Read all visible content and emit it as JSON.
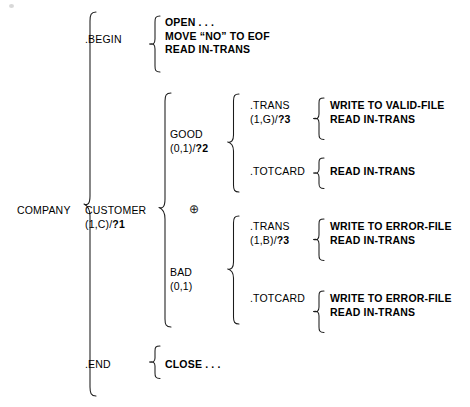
{
  "diagram": {
    "type": "warnier-orr",
    "root": {
      "name": "COMPANY",
      "label": "COMPANY"
    },
    "level1": [
      {
        "name": "begin",
        "label": ".BEGIN"
      },
      {
        "name": "customer",
        "label": "CUSTOMER",
        "sublabel": "(1,C)/",
        "suffix": "?1"
      },
      {
        "name": "end",
        "label": ".END"
      }
    ],
    "begin_actions": [
      "OPEN . . .",
      "MOVE “NO” TO EOF",
      "READ IN-TRANS"
    ],
    "end_actions": [
      "CLOSE . . ."
    ],
    "xor_symbol": "⊕",
    "branches": [
      {
        "name": "good",
        "label": "GOOD",
        "sublabel": "(0,1)/",
        "suffix": "?2",
        "children": [
          {
            "name": "good-trans",
            "label": ".TRANS",
            "sublabel": "(1,G)/",
            "suffix": "?3",
            "actions": [
              "WRITE TO VALID-FILE",
              "READ IN-TRANS"
            ]
          },
          {
            "name": "good-totcard",
            "label": ".TOTCARD",
            "sublabel": "",
            "suffix": "",
            "actions": [
              "READ IN-TRANS"
            ]
          }
        ]
      },
      {
        "name": "bad",
        "label": "BAD",
        "sublabel": "(0,1)",
        "suffix": "",
        "children": [
          {
            "name": "bad-trans",
            "label": ".TRANS",
            "sublabel": "(1,B)/",
            "suffix": "?3",
            "actions": [
              "WRITE TO ERROR-FILE",
              "READ IN-TRANS"
            ]
          },
          {
            "name": "bad-totcard",
            "label": ".TOTCARD",
            "sublabel": "",
            "suffix": "",
            "actions": [
              "WRITE TO ERROR-FILE",
              "READ IN-TRANS"
            ]
          }
        ]
      }
    ],
    "colors": {
      "ink": "#1b1b1b",
      "background": "#ffffff"
    }
  }
}
